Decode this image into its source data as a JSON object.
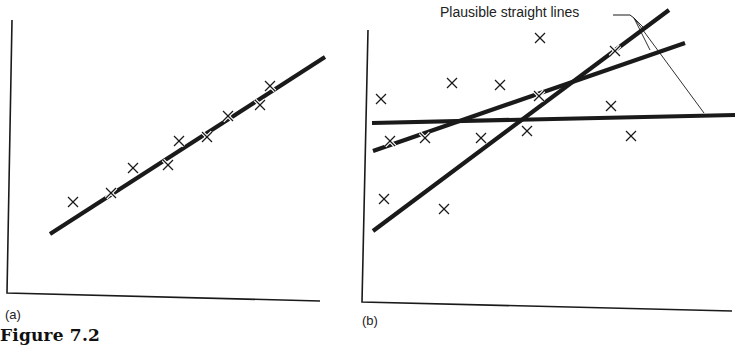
{
  "figure": {
    "caption": "Figure 7.2",
    "panels": [
      {
        "id": "a",
        "label": "(a)"
      },
      {
        "id": "b",
        "label": "(b)"
      }
    ],
    "annotation": "Plausible straight lines"
  },
  "colors": {
    "ink": "#1a1a1a",
    "background": "#ffffff"
  },
  "chart_data": [
    {
      "type": "scatter",
      "title": "(a)",
      "xlabel": "",
      "ylabel": "",
      "description": "Points lying close to a single fitted straight line",
      "points_px": [
        [
          73,
          202
        ],
        [
          111,
          193
        ],
        [
          133,
          168
        ],
        [
          168,
          165
        ],
        [
          179,
          141
        ],
        [
          207,
          137
        ],
        [
          228,
          116
        ],
        [
          260,
          105
        ],
        [
          270,
          86
        ]
      ],
      "fit_lines_px": [
        {
          "name": "best fit",
          "from": [
            50,
            234
          ],
          "to": [
            325,
            57
          ]
        }
      ],
      "axes_px": {
        "y_axis": [
          [
            12,
            20
          ],
          [
            7,
            293
          ]
        ],
        "x_axis": [
          [
            7,
            293
          ],
          [
            320,
            301
          ]
        ]
      },
      "grid": false
    },
    {
      "type": "scatter",
      "title": "(b)",
      "xlabel": "",
      "ylabel": "",
      "description": "Widely scattered points with several plausible straight lines",
      "points_px": [
        [
          381,
          99
        ],
        [
          390,
          141
        ],
        [
          384,
          199
        ],
        [
          425,
          138
        ],
        [
          452,
          83
        ],
        [
          444,
          209
        ],
        [
          481,
          138
        ],
        [
          500,
          85
        ],
        [
          527,
          131
        ],
        [
          540,
          38
        ],
        [
          539,
          96
        ],
        [
          615,
          51
        ],
        [
          611,
          106
        ],
        [
          631,
          136
        ]
      ],
      "fit_lines_px": [
        {
          "name": "horizontal",
          "from": [
            372,
            123
          ],
          "to": [
            735,
            115
          ]
        },
        {
          "name": "steep",
          "from": [
            373,
            231
          ],
          "to": [
            669,
            10
          ]
        },
        {
          "name": "medium",
          "from": [
            373,
            151
          ],
          "to": [
            685,
            43
          ]
        }
      ],
      "annotation": {
        "text": "Plausible straight lines",
        "leaders_to": [
          [
            646,
            30
          ],
          [
            650,
            50
          ],
          [
            704,
            113
          ]
        ]
      },
      "axes_px": {
        "y_axis": [
          [
            368,
            30
          ],
          [
            362,
            302
          ]
        ],
        "x_axis": [
          [
            362,
            302
          ],
          [
            732,
            311
          ]
        ]
      },
      "grid": false
    }
  ]
}
